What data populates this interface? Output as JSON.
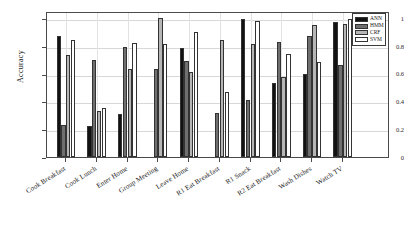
{
  "chart_data": {
    "type": "bar",
    "title": "",
    "xlabel": "",
    "ylabel": "Accuracy",
    "ylim": [
      0,
      1.05
    ],
    "yticks": [
      "0",
      "0.2",
      "0.4",
      "0.6",
      "0.8",
      "1"
    ],
    "ytick_values": [
      0,
      0.2,
      0.4,
      0.6,
      0.8,
      1
    ],
    "grid": true,
    "legend_position": "top-right",
    "categories": [
      "Cook Breakfast",
      "Cook Lunch",
      "Enter Home",
      "Group Meeting",
      "Leave Home",
      "R1 Eat Breakfast",
      "R1 Snack",
      "R2 Eat Breakfast",
      "Wash Dishes",
      "Watch TV"
    ],
    "series": [
      {
        "name": "ANN",
        "color": "#121212",
        "values": [
          0.87,
          0.22,
          0.31,
          0.0,
          0.785,
          0.0,
          0.99,
          0.53,
          0.6,
          0.97
        ]
      },
      {
        "name": "HMM",
        "color": "#6f6f6f",
        "values": [
          0.23,
          0.7,
          0.79,
          0.635,
          0.69,
          0.315,
          0.41,
          0.825,
          0.87,
          0.66
        ]
      },
      {
        "name": "CRF",
        "color": "#b6b6b6",
        "values": [
          0.735,
          0.33,
          0.635,
          1.0,
          0.615,
          0.84,
          0.81,
          0.575,
          0.95,
          0.955
        ]
      },
      {
        "name": "SVM",
        "color": "#ffffff",
        "values": [
          0.84,
          0.355,
          0.82,
          0.815,
          0.9,
          0.465,
          0.975,
          0.74,
          0.685,
          0.99
        ]
      }
    ]
  },
  "legend": {
    "entries": [
      "ANN",
      "HMM",
      "CRF",
      "SVM"
    ]
  },
  "axis": {
    "y_label": "Accuracy"
  }
}
